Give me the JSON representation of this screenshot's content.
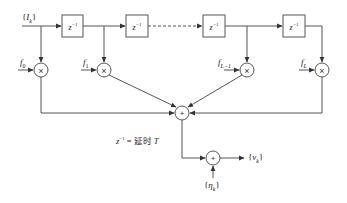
{
  "diagram": {
    "type": "tapped-delay-line channel model",
    "input_label": "{I_k}",
    "delay_label": "z⁻¹",
    "delay_count": 4,
    "tap_labels": [
      "f₀",
      "f₁",
      "f_{L−1}",
      "f_L"
    ],
    "tap_labels_display": [
      {
        "base": "f",
        "sub": "0"
      },
      {
        "base": "f",
        "sub": "1"
      },
      {
        "base": "f",
        "sub": "L−1"
      },
      {
        "base": "f",
        "sub": "L"
      }
    ],
    "multiplier_symbol": "×",
    "adder_symbol": "+",
    "note": "z⁻¹ = 延时 T",
    "note_parts": {
      "lhs": "z",
      "sup": "−1",
      "eq": " = 延时 ",
      "T": "T"
    },
    "noise_label": {
      "base": "η",
      "sub": "k"
    },
    "output_label": {
      "base": "v",
      "sub": "k"
    },
    "input_label_parts": {
      "base": "I",
      "sub": "k"
    },
    "colors": {
      "line": "#555555",
      "text": "#222222",
      "background": "#ffffff"
    }
  }
}
